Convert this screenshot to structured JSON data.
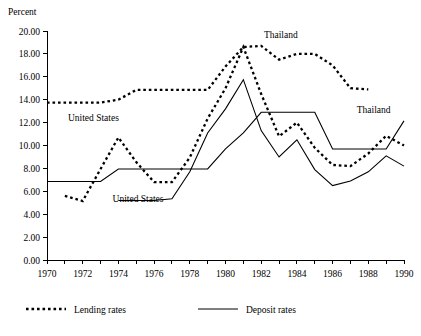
{
  "chart_data": {
    "type": "line",
    "title": "",
    "ylabel": "Percent",
    "xlabel": "",
    "ylim": [
      0,
      20
    ],
    "xlim": [
      1970,
      1990
    ],
    "ytick_labels": [
      "0.00",
      "2.00",
      "4.00",
      "6.00",
      "8.00",
      "10.00",
      "12.00",
      "14.00",
      "16.00",
      "18.00",
      "20.00"
    ],
    "ytick_values": [
      0,
      2,
      4,
      6,
      8,
      10,
      12,
      14,
      16,
      18,
      20
    ],
    "xtick_labels": [
      "1970",
      "1972",
      "1974",
      "1976",
      "1978",
      "1980",
      "1982",
      "1984",
      "1986",
      "1988",
      "1990"
    ],
    "xtick_values": [
      1970,
      1972,
      1974,
      1976,
      1978,
      1980,
      1982,
      1984,
      1986,
      1988,
      1990
    ],
    "xtick_minor_values": [
      1971,
      1973,
      1975,
      1977,
      1979,
      1981,
      1983,
      1985,
      1987,
      1989
    ],
    "grid": false,
    "legend_position": "bottom",
    "x": [
      1970,
      1971,
      1972,
      1973,
      1974,
      1975,
      1976,
      1977,
      1978,
      1979,
      1980,
      1981,
      1982,
      1983,
      1984,
      1985,
      1986,
      1987,
      1988,
      1989,
      1990
    ],
    "series": [
      {
        "name": "Thailand lending rates",
        "style": "dotted",
        "label": "Thailand",
        "values": [
          13.75,
          13.75,
          13.75,
          13.75,
          14.0,
          14.85,
          14.85,
          14.85,
          14.85,
          14.85,
          16.9,
          18.6,
          18.7,
          17.5,
          18.0,
          18.0,
          17.0,
          15.0,
          14.9,
          null,
          null
        ]
      },
      {
        "name": "Thailand deposit rates",
        "style": "solid",
        "label": "Thailand",
        "values": [
          6.85,
          6.85,
          6.85,
          6.85,
          7.95,
          7.95,
          7.95,
          7.95,
          7.95,
          7.95,
          9.7,
          11.1,
          12.9,
          12.9,
          12.9,
          12.9,
          9.7,
          9.7,
          9.7,
          9.7,
          12.15
        ]
      },
      {
        "name": "United States lending rates",
        "style": "dotted",
        "label": "United States",
        "values": [
          null,
          5.6,
          5.15,
          7.95,
          10.7,
          8.55,
          6.8,
          6.8,
          8.95,
          12.35,
          15.0,
          18.6,
          14.5,
          10.8,
          12.0,
          9.8,
          8.3,
          8.2,
          9.3,
          10.85,
          10.0
        ]
      },
      {
        "name": "United States deposit rates",
        "style": "solid",
        "label": "United States",
        "values": [
          null,
          null,
          null,
          null,
          5.2,
          5.2,
          5.2,
          5.35,
          7.7,
          11.1,
          13.2,
          15.75,
          11.3,
          9.0,
          10.5,
          7.9,
          6.5,
          6.9,
          7.7,
          9.1,
          8.2
        ]
      }
    ],
    "annotations": [
      {
        "text": "Thailand",
        "x": 1983.1,
        "y": 19.4,
        "series": "Thailand lending rates"
      },
      {
        "text": "Thailand",
        "x": 1988.3,
        "y": 12.8,
        "series": "Thailand deposit rates"
      },
      {
        "text": "United States",
        "x": 1972.6,
        "y": 12.1,
        "series": "United States lending rates"
      },
      {
        "text": "United States",
        "x": 1975.1,
        "y": 5.05,
        "series": "United States deposit rates"
      }
    ],
    "legend": [
      {
        "label": "Lending rates",
        "style": "dotted"
      },
      {
        "label": "Deposit rates",
        "style": "solid"
      }
    ]
  }
}
